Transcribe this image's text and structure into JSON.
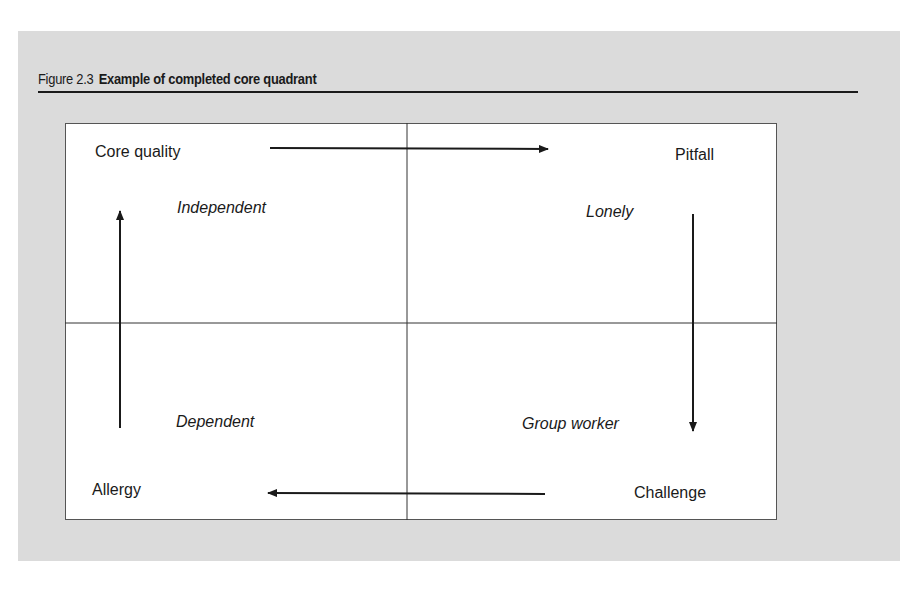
{
  "figure": {
    "number": "Figure 2.3",
    "title": "Example of completed core quadrant"
  },
  "quadrant": {
    "corners": {
      "top_left": "Core quality",
      "top_right": "Pitfall",
      "bottom_right": "Challenge",
      "bottom_left": "Allergy"
    },
    "examples": {
      "top_left": "Independent",
      "top_right": "Lonely",
      "bottom_right": "Group worker",
      "bottom_left": "Dependent"
    },
    "flow": [
      {
        "from": "Core quality",
        "to": "Pitfall",
        "direction": "right"
      },
      {
        "from": "Pitfall",
        "to": "Challenge",
        "direction": "down"
      },
      {
        "from": "Challenge",
        "to": "Allergy",
        "direction": "left"
      },
      {
        "from": "Allergy",
        "to": "Core quality",
        "direction": "up"
      }
    ]
  },
  "colors": {
    "panel_background": "#dbdbdb",
    "box_background": "#ffffff",
    "ink": "#1a1a1a"
  }
}
